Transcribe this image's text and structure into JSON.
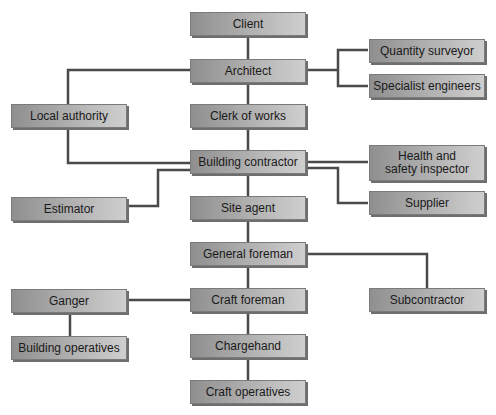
{
  "diagram": {
    "type": "organisation-chart",
    "nodes": {
      "client": "Client",
      "architect": "Architect",
      "quantity_surveyor": "Quantity surveyor",
      "specialist_engineers": "Specialist engineers",
      "local_authority": "Local authority",
      "clerk_of_works": "Clerk of works",
      "building_contractor": "Building contractor",
      "health_safety_inspector": "Health and safety inspector",
      "estimator": "Estimator",
      "site_agent": "Site agent",
      "supplier": "Supplier",
      "general_foreman": "General foreman",
      "subcontractor": "Subcontractor",
      "ganger": "Ganger",
      "craft_foreman": "Craft foreman",
      "building_operatives": "Building operatives",
      "chargehand": "Chargehand",
      "craft_operatives": "Craft operatives"
    },
    "edges": [
      [
        "Client",
        "Architect"
      ],
      [
        "Architect",
        "Quantity surveyor"
      ],
      [
        "Architect",
        "Specialist engineers"
      ],
      [
        "Architect",
        "Local authority"
      ],
      [
        "Architect",
        "Clerk of works"
      ],
      [
        "Local authority",
        "Building contractor"
      ],
      [
        "Clerk of works",
        "Building contractor"
      ],
      [
        "Building contractor",
        "Health and safety inspector"
      ],
      [
        "Building contractor",
        "Supplier"
      ],
      [
        "Building contractor",
        "Estimator"
      ],
      [
        "Building contractor",
        "Site agent"
      ],
      [
        "Site agent",
        "General foreman"
      ],
      [
        "General foreman",
        "Subcontractor"
      ],
      [
        "General foreman",
        "Craft foreman"
      ],
      [
        "Craft foreman",
        "Ganger"
      ],
      [
        "Ganger",
        "Building operatives"
      ],
      [
        "Craft foreman",
        "Chargehand"
      ],
      [
        "Chargehand",
        "Craft operatives"
      ]
    ]
  }
}
